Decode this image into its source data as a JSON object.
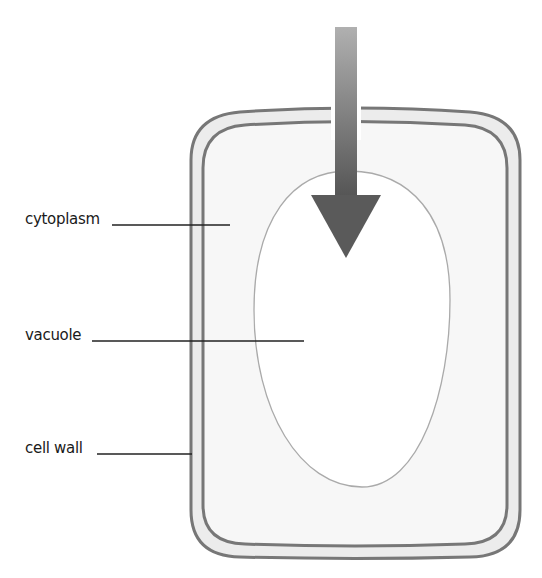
{
  "diagram": {
    "type": "plant-cell",
    "labels": {
      "cytoplasm": "cytoplasm",
      "vacuole": "vacuole",
      "cell_wall": "cell wall"
    },
    "arrow": {
      "direction": "down",
      "meaning": "water-entering-cell"
    },
    "colors": {
      "wall_line": "#777777",
      "wall_fill": "#ececec",
      "cytoplasm_fill": "#f7f7f7",
      "vacuole_line": "#aaaaaa",
      "vacuole_fill": "#ffffff",
      "arrow_top": "#aaaaaa",
      "arrow_bottom": "#5a5a5a",
      "leader_line": "#222222",
      "label_text": "#1a1a1a"
    }
  }
}
